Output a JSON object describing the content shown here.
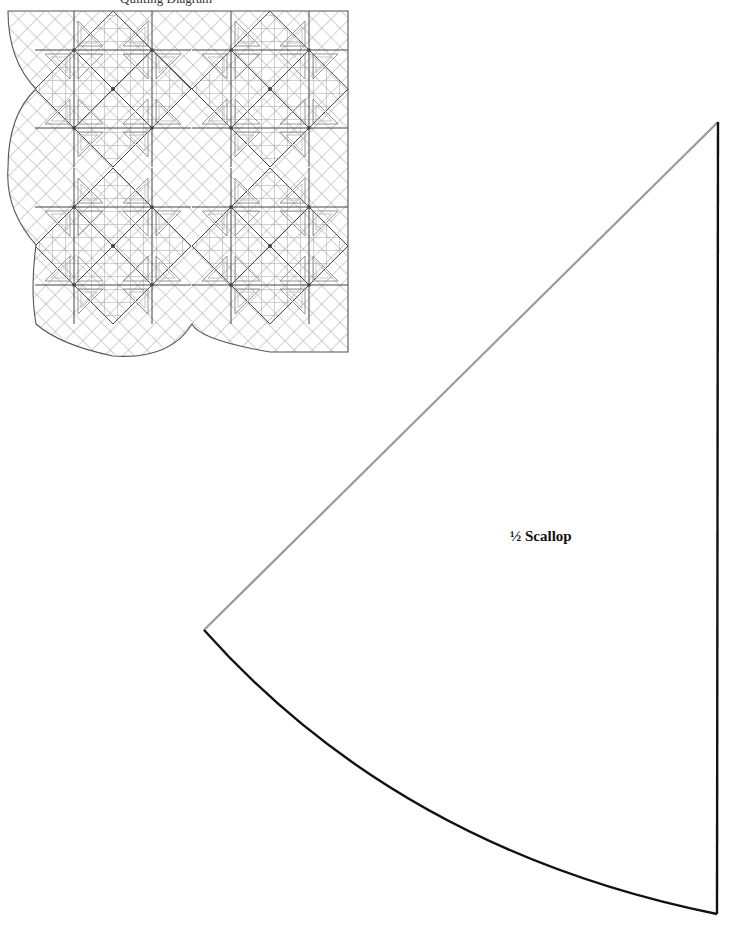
{
  "page": {
    "caption_partial": "Quilting Diagram",
    "quilt_diagram": {
      "description": "Quilting diagram corner with scalloped border",
      "outline_color": "#555555",
      "grid_color": "#999999",
      "blocks": [
        {
          "name": "block-top-left",
          "cx": 113,
          "cy": 89
        },
        {
          "name": "block-top-right",
          "cx": 270,
          "cy": 89
        },
        {
          "name": "block-bottom-left",
          "cx": 113,
          "cy": 246
        },
        {
          "name": "block-bottom-right",
          "cx": 270,
          "cy": 246
        }
      ]
    },
    "template": {
      "label": "½ Scallop",
      "edge_color_straight_top": "#999999",
      "edge_color_outline": "#111111"
    }
  }
}
